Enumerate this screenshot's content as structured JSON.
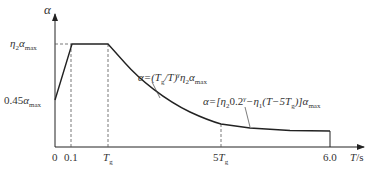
{
  "diagram": {
    "y_axis": {
      "label": "α"
    },
    "x_axis": {
      "label_T": "T",
      "label_unit": "/s"
    },
    "y_ticks": {
      "top": {
        "coef": "η",
        "coef_sub": "2",
        "alpha": "α",
        "sub": "max"
      },
      "bottom": {
        "prefix": "0.45",
        "alpha": "α",
        "sub": "max"
      }
    },
    "x_ticks": {
      "zero": "0",
      "t01": "0.1",
      "tg": {
        "main": "T",
        "sub": "g"
      },
      "t5g": {
        "prefix": "5",
        "main": "T",
        "sub": "g"
      },
      "t6": "6.0"
    },
    "annotations": {
      "curve": {
        "a": "α=(T",
        "sub_g": "g",
        "b": "/T)",
        "sup_gamma": "γ",
        "c": "η",
        "sub_2": "2",
        "d": "α",
        "sub_max": "max"
      },
      "linear": {
        "a": "α=[η",
        "sub_2": "2",
        "b": "0.2",
        "sup_gamma": "γ",
        "c": "−η",
        "sub_1": "1",
        "d": "(T−5T",
        "sub_g": "g",
        "e": ")]α",
        "sub_max": "max"
      }
    },
    "colors": {
      "line": "#222222",
      "dash": "#555555",
      "text": "#333333"
    }
  }
}
